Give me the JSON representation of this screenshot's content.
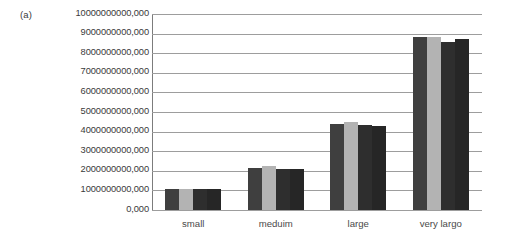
{
  "panel": {
    "label": "(a)"
  },
  "chart_data": {
    "type": "bar",
    "title": "",
    "subtitle": "",
    "xlabel": "",
    "ylabel": "",
    "categories": [
      "small",
      "meduim",
      "large",
      "very largo"
    ],
    "ylim": [
      0,
      10000000000000
    ],
    "ytick_labels": [
      "10000000000,000",
      "9000000000,000",
      "8000000000,000",
      "7000000000,000",
      "6000000000,000",
      "5000000000,000",
      "4000000000,000",
      "3000000000,000",
      "2000000000,000",
      "1000000000,000",
      "0,000"
    ],
    "ytick_values": [
      10000000000000,
      9000000000000,
      8000000000000,
      7000000000000,
      6000000000000,
      5000000000000,
      4000000000000,
      3000000000000,
      2000000000000,
      1000000000000,
      0
    ],
    "grid": true,
    "grid_axis": "y",
    "legend": false,
    "legend_position": "none",
    "series": [
      {
        "name": "series-1",
        "color": "#3f3f3f",
        "values": [
          1050000000000,
          2150000000000,
          4400000000000,
          8850000000000
        ]
      },
      {
        "name": "series-2",
        "color": "#b3b3b3",
        "values": [
          1080000000000,
          2250000000000,
          4500000000000,
          8850000000000
        ]
      },
      {
        "name": "series-3",
        "color": "#2e2e2e",
        "values": [
          1050000000000,
          2100000000000,
          4350000000000,
          8550000000000
        ]
      },
      {
        "name": "series-4",
        "color": "#262626",
        "values": [
          1050000000000,
          2100000000000,
          4300000000000,
          8700000000000
        ]
      }
    ]
  }
}
